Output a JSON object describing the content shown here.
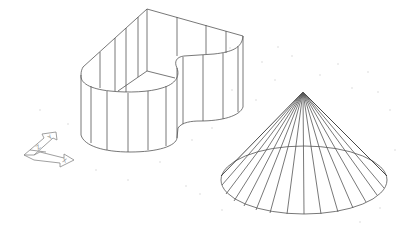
{
  "viewport": {
    "type": "3d-wireframe-cad-viewport",
    "background_color": "#ffffff",
    "edge_color": "#555555",
    "grid_dot_color": "#d8d8d8"
  },
  "objects": [
    {
      "name": "extruded-solid",
      "kind": "extrusion",
      "description": "Extruded closed profile with rounded ends and a concave notch, shown as wireframe with vertical isolines"
    },
    {
      "name": "cone",
      "kind": "cone",
      "description": "Cone with apex at top and elliptical base, wireframe with radial generator lines"
    }
  ],
  "ucs_icon": {
    "axes": [
      {
        "label": "X"
      },
      {
        "label": "Y"
      },
      {
        "label": "Z"
      }
    ]
  }
}
